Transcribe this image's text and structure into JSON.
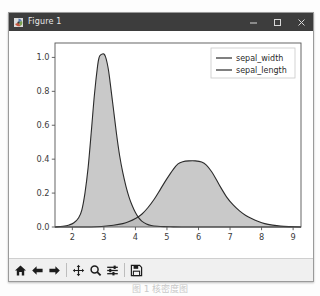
{
  "window": {
    "title": "Figure 1",
    "icon": "matplotlib-icon",
    "controls": {
      "minimize": "minimize-button",
      "maximize": "maximize-button",
      "close": "close-button"
    }
  },
  "toolbar": {
    "items": [
      {
        "name": "home-icon",
        "tooltip": "Reset original view"
      },
      {
        "name": "back-arrow-icon",
        "tooltip": "Back to previous view"
      },
      {
        "name": "forward-arrow-icon",
        "tooltip": "Forward to next view"
      },
      {
        "name": "pan-move-icon",
        "tooltip": "Pan axes with left mouse, zoom with right"
      },
      {
        "name": "zoom-magnifier-icon",
        "tooltip": "Zoom to rectangle"
      },
      {
        "name": "configure-subplots-icon",
        "tooltip": "Configure subplots"
      },
      {
        "name": "save-floppy-icon",
        "tooltip": "Save the figure"
      }
    ]
  },
  "caption": "图 1 核密度图",
  "chart_data": {
    "type": "area",
    "title": "",
    "xlabel": "",
    "ylabel": "",
    "xlim": [
      1.45,
      9.25
    ],
    "ylim": [
      0.0,
      1.085
    ],
    "xticks": [
      2,
      3,
      4,
      5,
      6,
      7,
      8,
      9
    ],
    "yticks": [
      0.0,
      0.2,
      0.4,
      0.6,
      0.8,
      1.0
    ],
    "xticklabels": [
      "2",
      "3",
      "4",
      "5",
      "6",
      "7",
      "8",
      "9"
    ],
    "yticklabels": [
      "0.0",
      "0.2",
      "0.4",
      "0.6",
      "0.8",
      "1.0"
    ],
    "grid": false,
    "legend_position": "upper right",
    "fill_color": "#b7b7b7",
    "fill_opacity": 0.75,
    "line_color": "#2b2b2b",
    "series": [
      {
        "name": "sepal_width",
        "peak_x": 3.0,
        "peak_y": 1.02,
        "x": [
          1.45,
          1.7,
          1.9,
          2.05,
          2.2,
          2.3,
          2.4,
          2.5,
          2.6,
          2.7,
          2.8,
          2.85,
          2.9,
          2.95,
          3.0,
          3.05,
          3.1,
          3.15,
          3.2,
          3.3,
          3.4,
          3.5,
          3.6,
          3.7,
          3.8,
          3.9,
          4.0,
          4.1,
          4.2,
          4.35,
          4.5,
          4.7,
          4.9,
          5.2,
          5.6,
          6.0,
          9.25
        ],
        "y": [
          0.0,
          0.004,
          0.012,
          0.025,
          0.055,
          0.1,
          0.2,
          0.35,
          0.56,
          0.78,
          0.95,
          1.0,
          1.015,
          1.02,
          1.02,
          1.005,
          0.97,
          0.92,
          0.85,
          0.7,
          0.55,
          0.42,
          0.32,
          0.24,
          0.175,
          0.125,
          0.085,
          0.055,
          0.035,
          0.018,
          0.009,
          0.004,
          0.002,
          0.001,
          0.0,
          0.0,
          0.0
        ]
      },
      {
        "name": "sepal_length",
        "peak_x": 5.8,
        "peak_y": 0.39,
        "x": [
          1.45,
          2.6,
          3.0,
          3.3,
          3.6,
          3.8,
          4.0,
          4.2,
          4.4,
          4.6,
          4.8,
          5.0,
          5.2,
          5.35,
          5.5,
          5.7,
          5.9,
          6.1,
          6.25,
          6.4,
          6.55,
          6.7,
          6.9,
          7.1,
          7.3,
          7.5,
          7.7,
          7.9,
          8.1,
          8.35,
          8.6,
          8.9,
          9.25
        ],
        "y": [
          0.0,
          0.0,
          0.004,
          0.01,
          0.02,
          0.032,
          0.05,
          0.075,
          0.115,
          0.165,
          0.225,
          0.285,
          0.34,
          0.372,
          0.385,
          0.39,
          0.39,
          0.383,
          0.365,
          0.33,
          0.285,
          0.235,
          0.175,
          0.13,
          0.095,
          0.068,
          0.048,
          0.032,
          0.02,
          0.011,
          0.005,
          0.002,
          0.0
        ]
      }
    ],
    "legend": [
      {
        "label": "sepal_width",
        "color": "#2b2b2b"
      },
      {
        "label": "sepal_length",
        "color": "#2b2b2b"
      }
    ]
  }
}
